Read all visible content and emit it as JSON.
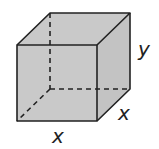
{
  "diagram": {
    "type": "cube",
    "labels": {
      "height": "y",
      "depth": "x",
      "width": "x"
    },
    "colors": {
      "fill": "#c9c9c9",
      "edge": "#222222",
      "background": "#ffffff"
    }
  }
}
